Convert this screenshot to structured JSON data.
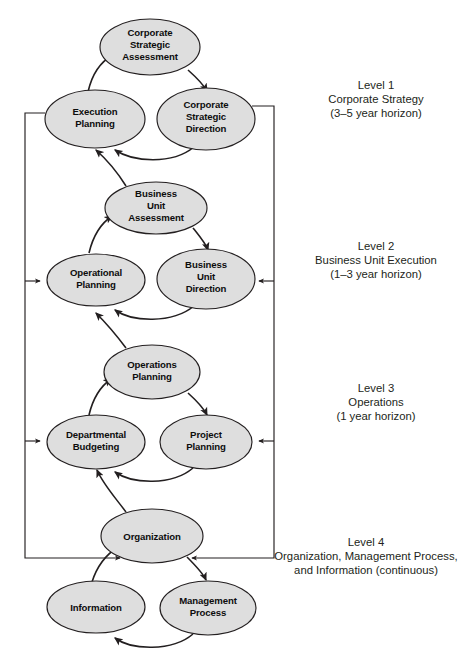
{
  "diagram": {
    "colors": {
      "node_fill": "#dedede",
      "node_stroke": "#231f20",
      "arrow": "#231f20",
      "text": "#0d0d0d",
      "background": "#ffffff"
    },
    "nodes": [
      {
        "id": "corporate-strategic-assessment",
        "lines": [
          "Corporate",
          "Strategic",
          "Assessment"
        ],
        "cx": 150,
        "cy": 47,
        "rx": 50,
        "ry": 28
      },
      {
        "id": "execution-planning",
        "lines": [
          "Execution",
          "Planning"
        ],
        "cx": 95,
        "cy": 119,
        "rx": 50,
        "ry": 29
      },
      {
        "id": "corporate-strategic-direction",
        "lines": [
          "Corporate",
          "Strategic",
          "Direction"
        ],
        "cx": 206,
        "cy": 119,
        "rx": 49,
        "ry": 31
      },
      {
        "id": "business-unit-assessment",
        "lines": [
          "Business",
          "Unit",
          "Assessment"
        ],
        "cx": 156,
        "cy": 208,
        "rx": 51,
        "ry": 26
      },
      {
        "id": "operational-planning",
        "lines": [
          "Operational",
          "Planning"
        ],
        "cx": 96,
        "cy": 280,
        "rx": 49,
        "ry": 26
      },
      {
        "id": "business-unit-direction",
        "lines": [
          "Business",
          "Unit",
          "Direction"
        ],
        "cx": 206,
        "cy": 279,
        "rx": 49,
        "ry": 30
      },
      {
        "id": "operations-planning",
        "lines": [
          "Operations",
          "Planning"
        ],
        "cx": 152,
        "cy": 372,
        "rx": 48,
        "ry": 27
      },
      {
        "id": "departmental-budgeting",
        "lines": [
          "Departmental",
          "Budgeting"
        ],
        "cx": 96,
        "cy": 442,
        "rx": 49,
        "ry": 27
      },
      {
        "id": "project-planning",
        "lines": [
          "Project",
          "Planning"
        ],
        "cx": 206,
        "cy": 442,
        "rx": 46,
        "ry": 27
      },
      {
        "id": "organization",
        "lines": [
          "Organization"
        ],
        "cx": 152,
        "cy": 536,
        "rx": 51,
        "ry": 27
      },
      {
        "id": "information",
        "lines": [
          "Information"
        ],
        "cx": 96,
        "cy": 607,
        "rx": 49,
        "ry": 26
      },
      {
        "id": "management-process",
        "lines": [
          "Management",
          "Process"
        ],
        "cx": 208,
        "cy": 608,
        "rx": 48,
        "ry": 27
      }
    ],
    "level_labels": [
      {
        "id": "level-1",
        "lines": [
          "Level 1",
          "Corporate Strategy",
          "(3–5 year horizon)"
        ],
        "x": 376,
        "y": 101
      },
      {
        "id": "level-2",
        "lines": [
          "Level 2",
          "Business Unit Execution",
          "(1–3 year horizon)"
        ],
        "x": 376,
        "y": 255
      },
      {
        "id": "level-3",
        "lines": [
          "Level 3",
          "Operations",
          "(1 year horizon)"
        ],
        "x": 376,
        "y": 397
      },
      {
        "id": "level-4",
        "lines": [
          "Level 4",
          "Organization, Management Process,",
          "and Information (continuous)"
        ],
        "x": 366,
        "y": 551
      }
    ]
  }
}
